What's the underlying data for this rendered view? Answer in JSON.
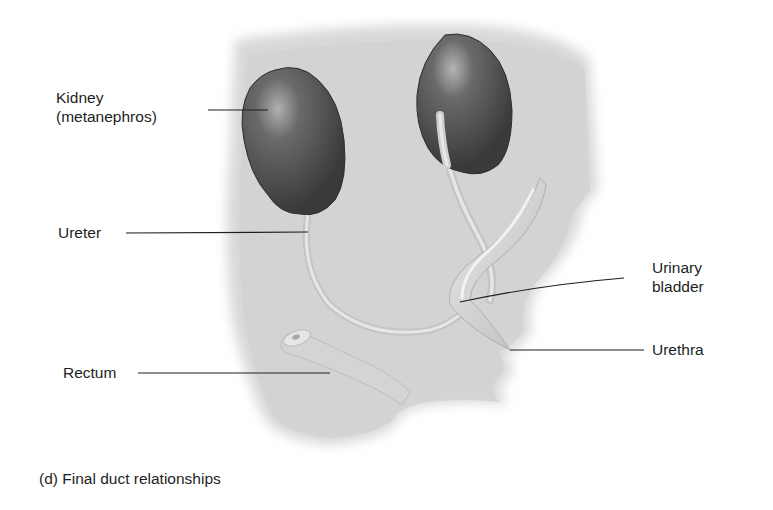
{
  "diagram": {
    "caption": "(d) Final duct relationships",
    "labels": {
      "kidney_line1": "Kidney",
      "kidney_line2": "(metanephros)",
      "ureter": "Ureter",
      "bladder_line1": "Urinary",
      "bladder_line2": "bladder",
      "urethra": "Urethra",
      "rectum": "Rectum"
    },
    "colors": {
      "background": "#ffffff",
      "body_silhouette": "#d9d9d9",
      "kidney": "#4a4a4a",
      "kidney_highlight": "#9a9a9a",
      "duct": "#cfcfcf",
      "duct_highlight": "#ececec",
      "leader_line": "#1e1e1e",
      "text": "#1e1e1e"
    }
  }
}
